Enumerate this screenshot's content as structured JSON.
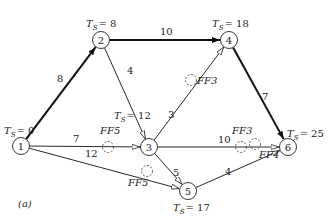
{
  "diagram": {
    "caption": "(a)",
    "nodes": [
      {
        "id": "1",
        "x": 21,
        "y": 146,
        "ts_label": "T",
        "ts_sub": "S",
        "ts_value": "= 0",
        "lx": 4,
        "ly": 134
      },
      {
        "id": "2",
        "x": 101,
        "y": 40,
        "ts_label": "T",
        "ts_sub": "S",
        "ts_value": "= 8",
        "lx": 86,
        "ly": 27
      },
      {
        "id": "3",
        "x": 149,
        "y": 147,
        "ts_label": "T",
        "ts_sub": "S",
        "ts_value": "= 12",
        "lx": 114,
        "ly": 119
      },
      {
        "id": "4",
        "x": 229,
        "y": 40,
        "ts_label": "T",
        "ts_sub": "S",
        "ts_value": "= 18",
        "lx": 212,
        "ly": 27
      },
      {
        "id": "5",
        "x": 188,
        "y": 191,
        "ts_label": "T",
        "ts_sub": "S",
        "ts_value": "= 17",
        "lx": 173,
        "ly": 211
      },
      {
        "id": "6",
        "x": 288,
        "y": 147,
        "ts_label": "T",
        "ts_sub": "S",
        "ts_value": "= 25",
        "lx": 287,
        "ly": 137
      }
    ],
    "edges": [
      {
        "from": "1",
        "to": "2",
        "weight": "8",
        "critical": true,
        "wx": 57,
        "wy": 82
      },
      {
        "from": "2",
        "to": "4",
        "weight": "10",
        "critical": true,
        "wx": 160,
        "wy": 35
      },
      {
        "from": "2",
        "to": "3",
        "weight": "4",
        "critical": false,
        "wx": 127,
        "wy": 74
      },
      {
        "from": "1",
        "to": "3",
        "weight": "7",
        "critical": false,
        "wx": 73,
        "wy": 142
      },
      {
        "from": "3",
        "to": "4",
        "weight": "3",
        "critical": false,
        "wx": 168,
        "wy": 118
      },
      {
        "from": "4",
        "to": "6",
        "weight": "7",
        "critical": true,
        "wx": 262,
        "wy": 100
      },
      {
        "from": "3",
        "to": "6",
        "weight": "10",
        "critical": false,
        "wx": 218,
        "wy": 143
      },
      {
        "from": "3",
        "to": "5",
        "weight": "5",
        "critical": false,
        "wx": 173,
        "wy": 176
      },
      {
        "from": "1",
        "to": "5",
        "weight": "12",
        "critical": false,
        "wx": 85,
        "wy": 157
      },
      {
        "from": "5",
        "to": "6",
        "weight": "4",
        "critical": false,
        "wx": 225,
        "wy": 175
      }
    ],
    "free_floats": [
      {
        "label": "FF5",
        "edge": "1-3",
        "cx": 108,
        "cy": 147,
        "lx": 100,
        "ly": 134
      },
      {
        "label": "FF3",
        "edge": "3-4",
        "cx": 191,
        "cy": 80,
        "lx": 197,
        "ly": 84
      },
      {
        "label": "FF3",
        "edge": "3-6",
        "cx": 241,
        "cy": 147,
        "lx": 232,
        "ly": 134
      },
      {
        "label": "FF5",
        "edge": "1-5",
        "cx": 147,
        "cy": 171,
        "lx": 128,
        "ly": 186
      },
      {
        "label": "FF4",
        "edge": "5-6",
        "cx": 255,
        "cy": 144,
        "lx": 259,
        "ly": 158
      }
    ]
  }
}
